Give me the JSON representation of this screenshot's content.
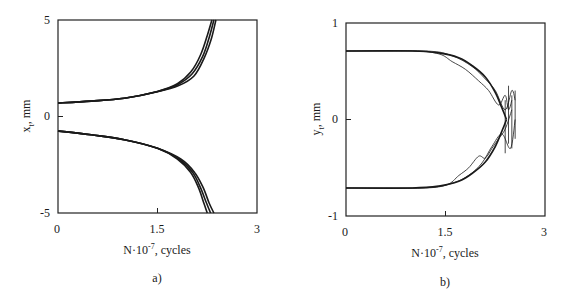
{
  "chart_data": [
    {
      "panel": "a)",
      "type": "line",
      "title": "",
      "xlabel": "N·10^-7, cycles",
      "xlabel_main": "N·10",
      "xlabel_exp": "-7",
      "xlabel_tail": ", cycles",
      "ylabel": "x_t, mm",
      "ylabel_main": "x",
      "ylabel_sub": "t",
      "ylabel_tail": ", mm",
      "xlim": [
        0,
        3
      ],
      "ylim": [
        -5,
        5
      ],
      "xticks": [
        "0",
        "1.5",
        "3"
      ],
      "yticks": [
        "5",
        "0",
        "-5"
      ],
      "grid": false,
      "legend": null,
      "series": [
        {
          "name": "upper branch 1",
          "x": [
            0,
            0.5,
            1.0,
            1.5,
            1.8,
            2.0,
            2.15,
            2.25,
            2.32
          ],
          "y": [
            0.7,
            0.8,
            0.95,
            1.3,
            1.7,
            2.3,
            3.2,
            4.2,
            5.0
          ]
        },
        {
          "name": "upper branch 2",
          "x": [
            0,
            0.5,
            1.0,
            1.5,
            1.8,
            2.02,
            2.18,
            2.28,
            2.35
          ],
          "y": [
            0.7,
            0.8,
            0.95,
            1.3,
            1.65,
            2.2,
            3.1,
            4.1,
            5.0
          ]
        },
        {
          "name": "upper branch 3",
          "x": [
            0,
            0.5,
            1.0,
            1.5,
            1.82,
            2.05,
            2.2,
            2.31,
            2.38
          ],
          "y": [
            0.7,
            0.8,
            0.95,
            1.28,
            1.6,
            2.1,
            3.0,
            4.0,
            5.0
          ]
        },
        {
          "name": "lower branch 1",
          "x": [
            0,
            0.5,
            1.0,
            1.5,
            1.8,
            2.0,
            2.12,
            2.2,
            2.25
          ],
          "y": [
            -0.75,
            -0.95,
            -1.2,
            -1.65,
            -2.2,
            -2.9,
            -3.7,
            -4.5,
            -5.0
          ]
        },
        {
          "name": "lower branch 2",
          "x": [
            0,
            0.5,
            1.0,
            1.5,
            1.82,
            2.03,
            2.15,
            2.24,
            2.3
          ],
          "y": [
            -0.75,
            -0.95,
            -1.2,
            -1.65,
            -2.2,
            -2.9,
            -3.7,
            -4.5,
            -5.0
          ]
        },
        {
          "name": "lower branch 3",
          "x": [
            0,
            0.5,
            1.0,
            1.5,
            1.85,
            2.06,
            2.19,
            2.28,
            2.35
          ],
          "y": [
            -0.75,
            -0.95,
            -1.2,
            -1.65,
            -2.2,
            -2.9,
            -3.7,
            -4.5,
            -5.0
          ]
        }
      ]
    },
    {
      "panel": "b)",
      "type": "line",
      "title": "",
      "xlabel": "N·10^-7, cycles",
      "xlabel_main": "N·10",
      "xlabel_exp": "-7",
      "xlabel_tail": ", cycles",
      "ylabel": "y_t, mm",
      "ylabel_main": "y",
      "ylabel_sub": "t",
      "ylabel_tail": ", mm",
      "xlim": [
        0,
        3
      ],
      "ylim": [
        -1,
        1
      ],
      "xticks": [
        "0",
        "1.5",
        "3"
      ],
      "yticks": [
        "1",
        "0",
        "-1"
      ],
      "grid": false,
      "legend": null,
      "series": [
        {
          "name": "smooth upper",
          "x": [
            0,
            1.0,
            1.4,
            1.7,
            1.9,
            2.1,
            2.25,
            2.35,
            2.42
          ],
          "y": [
            0.71,
            0.71,
            0.69,
            0.64,
            0.56,
            0.44,
            0.28,
            0.12,
            0.0
          ]
        },
        {
          "name": "smooth lower",
          "x": [
            0,
            1.0,
            1.4,
            1.7,
            1.9,
            2.1,
            2.25,
            2.35,
            2.42
          ],
          "y": [
            -0.71,
            -0.71,
            -0.69,
            -0.64,
            -0.56,
            -0.44,
            -0.28,
            -0.12,
            0.0
          ]
        },
        {
          "name": "noisy upper 1",
          "x": [
            0,
            1.0,
            1.4,
            1.6,
            1.8,
            2.0,
            2.15,
            2.3,
            2.4,
            2.45,
            2.5
          ],
          "y": [
            0.71,
            0.71,
            0.68,
            0.6,
            0.52,
            0.4,
            0.3,
            0.15,
            0.25,
            0.1,
            0.2
          ]
        },
        {
          "name": "noisy lower 1",
          "x": [
            0,
            1.0,
            1.5,
            1.7,
            1.85,
            2.0,
            2.1,
            2.2,
            2.3,
            2.4,
            2.5
          ],
          "y": [
            -0.71,
            -0.71,
            -0.68,
            -0.58,
            -0.5,
            -0.38,
            -0.4,
            -0.3,
            -0.2,
            -0.1,
            0.1
          ]
        },
        {
          "name": "noisy 2",
          "x": [
            0,
            1.2,
            1.6,
            1.9,
            2.1,
            2.25,
            2.4,
            2.5,
            2.55
          ],
          "y": [
            0.71,
            0.71,
            0.66,
            0.55,
            0.42,
            0.3,
            0.1,
            0.3,
            0.2
          ]
        },
        {
          "name": "noisy 3",
          "x": [
            0,
            1.2,
            1.6,
            1.85,
            2.05,
            2.2,
            2.35,
            2.48,
            2.55
          ],
          "y": [
            -0.71,
            -0.71,
            -0.66,
            -0.58,
            -0.45,
            -0.28,
            -0.15,
            -0.3,
            0.0
          ]
        }
      ]
    }
  ]
}
